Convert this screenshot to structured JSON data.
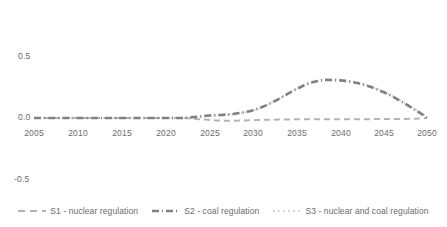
{
  "chart_data": {
    "type": "line",
    "title": "",
    "xlabel": "",
    "ylabel": "",
    "xlim": [
      2005,
      2050
    ],
    "ylim": [
      -0.5,
      0.5
    ],
    "grid": false,
    "legend_position": "bottom",
    "x_ticks": [
      "2005",
      "2010",
      "2015",
      "2020",
      "2025",
      "2030",
      "2035",
      "2040",
      "2045",
      "2050"
    ],
    "y_ticks": [
      "0.5",
      "0.0",
      "-0.5"
    ],
    "x": [
      2005,
      2006,
      2007,
      2008,
      2009,
      2010,
      2011,
      2012,
      2013,
      2014,
      2015,
      2016,
      2017,
      2018,
      2019,
      2020,
      2021,
      2022,
      2023,
      2024,
      2025,
      2026,
      2027,
      2028,
      2029,
      2030,
      2031,
      2032,
      2033,
      2034,
      2035,
      2036,
      2037,
      2038,
      2039,
      2040,
      2041,
      2042,
      2043,
      2044,
      2045,
      2046,
      2047,
      2048,
      2049,
      2050
    ],
    "series": [
      {
        "name": "S1 - nuclear regulation",
        "style": "dashed",
        "color": "#b3b3b3",
        "width": 2.0,
        "values": [
          0.0,
          0.0,
          0.0,
          0.0,
          0.0,
          0.0,
          0.0,
          0.0,
          0.0,
          0.0,
          0.0,
          0.0,
          0.0,
          0.0,
          0.0,
          0.0,
          0.0,
          0.0,
          -0.005,
          -0.01,
          -0.015,
          -0.02,
          -0.022,
          -0.022,
          -0.02,
          -0.018,
          -0.016,
          -0.014,
          -0.013,
          -0.012,
          -0.011,
          -0.011,
          -0.01,
          -0.01,
          -0.01,
          -0.01,
          -0.01,
          -0.01,
          -0.01,
          -0.009,
          -0.009,
          -0.008,
          -0.008,
          -0.007,
          -0.005,
          0.0
        ]
      },
      {
        "name": "S2 - coal regulation",
        "style": "dash-dot",
        "color": "#808080",
        "width": 2.6,
        "values": [
          0.0,
          0.0,
          0.0,
          0.0,
          0.0,
          0.0,
          0.0,
          0.0,
          0.0,
          0.0,
          0.0,
          0.0,
          0.0,
          0.0,
          0.0,
          0.0,
          0.0,
          0.0,
          0.005,
          0.012,
          0.02,
          0.024,
          0.028,
          0.035,
          0.046,
          0.062,
          0.086,
          0.118,
          0.155,
          0.196,
          0.235,
          0.27,
          0.295,
          0.31,
          0.312,
          0.308,
          0.3,
          0.287,
          0.268,
          0.243,
          0.213,
          0.178,
          0.138,
          0.095,
          0.05,
          0.005
        ]
      },
      {
        "name": "S3 - nuclear and coal regulation",
        "style": "dotted",
        "color": "#d0d0d0",
        "width": 2.0,
        "values": [
          0.0,
          0.0,
          0.0,
          0.0,
          0.0,
          0.0,
          0.0,
          0.0,
          0.0,
          0.0,
          0.0,
          0.0,
          0.0,
          0.0,
          0.0,
          0.0,
          0.0,
          0.0,
          0.004,
          0.01,
          0.017,
          0.02,
          0.024,
          0.031,
          0.043,
          0.06,
          0.085,
          0.118,
          0.157,
          0.198,
          0.238,
          0.273,
          0.299,
          0.314,
          0.317,
          0.313,
          0.305,
          0.292,
          0.273,
          0.248,
          0.218,
          0.183,
          0.143,
          0.1,
          0.055,
          0.008
        ]
      }
    ],
    "legend": [
      {
        "label": "S1 - nuclear regulation",
        "style": "dashed",
        "color": "#b3b3b3"
      },
      {
        "label": "S2 - coal regulation",
        "style": "dash-dot",
        "color": "#808080"
      },
      {
        "label": "S3 - nuclear and coal regulation",
        "style": "dotted",
        "color": "#d0d0d0"
      }
    ]
  }
}
